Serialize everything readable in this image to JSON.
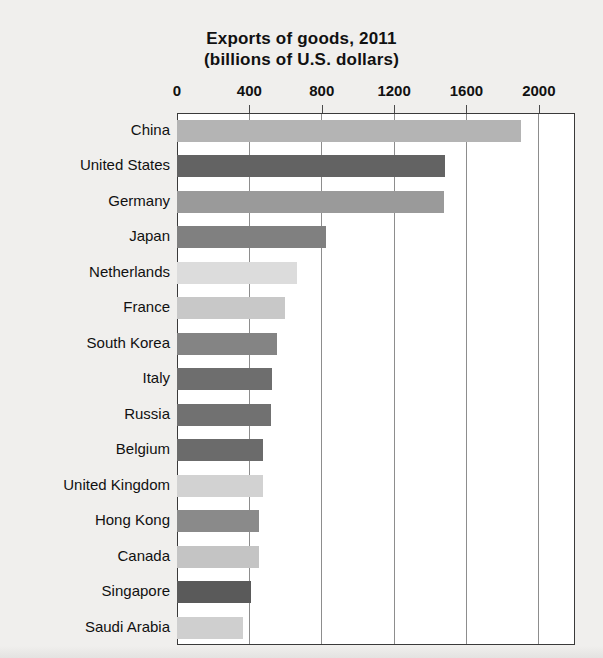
{
  "chart_data": {
    "type": "bar",
    "orientation": "horizontal",
    "title": "Exports of goods, 2011",
    "subtitle": "(billions of U.S. dollars)",
    "title_lines": [
      "Exports of goods, 2011",
      "(billions of U.S. dollars)"
    ],
    "xlabel": "",
    "ylabel": "",
    "xlim": [
      0,
      2200
    ],
    "xticks": [
      0,
      400,
      800,
      1200,
      1600,
      2000
    ],
    "xtick_labels": [
      "0",
      "400",
      "800",
      "1200",
      "1600",
      "2000"
    ],
    "grid": "vertical",
    "legend": "none",
    "categories": [
      "China",
      "United States",
      "Germany",
      "Japan",
      "Netherlands",
      "France",
      "South Korea",
      "Italy",
      "Russia",
      "Belgium",
      "United Kingdom",
      "Hong Kong",
      "Canada",
      "Singapore",
      "Saudi Arabia"
    ],
    "values": [
      1899,
      1480,
      1474,
      823,
      661,
      597,
      555,
      523,
      522,
      476,
      473,
      456,
      452,
      410,
      365
    ],
    "bar_colors": [
      "#b4b4b4",
      "#636363",
      "#9a9a9a",
      "#808080",
      "#dcdcdc",
      "#c8c8c8",
      "#848484",
      "#6e6e6e",
      "#717171",
      "#6b6b6b",
      "#d2d2d2",
      "#8a8a8a",
      "#c4c4c4",
      "#5a5a5a",
      "#cfcfcf"
    ]
  },
  "colors": {
    "background": "#f0efed",
    "plot_background": "#ffffff",
    "frame": "#3a3a3a",
    "gridline": "#8d8d8d",
    "text": "#111111"
  }
}
